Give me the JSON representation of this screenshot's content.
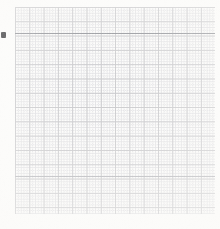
{
  "document": {
    "kind": "scanned-grid-paper",
    "title": "Graph paper scan",
    "width_px": 220,
    "height_px": 229
  },
  "paper": {
    "background_color": "#fdfdfc",
    "edge_color": "#f5f4f0"
  },
  "grid": {
    "left_px": 15,
    "top_px": 7,
    "width_px": 200,
    "height_px": 207,
    "major_spacing_px": 14.3,
    "minor_spacing_px": 2.86,
    "minor_per_major": 5,
    "major_columns": 14,
    "major_rows": 15,
    "major_color": "#c9c9cc",
    "major_line_width_px": 1,
    "minor_color": "#dedee1",
    "minor_dot_period_px": 2,
    "minor_dash_length_px": 1
  },
  "marks": {
    "emphasis_rule": {
      "label": "dark-horizontal-rule",
      "y_px": 33,
      "left_px": 15,
      "width_px": 200,
      "color": "#8e9096",
      "thickness_px": 1
    },
    "secondary_rule": {
      "label": "secondary-horizontal-rule",
      "y_px": 176,
      "left_px": 15,
      "width_px": 200,
      "color": "#b4b5ba",
      "thickness_px": 1
    },
    "ink_mark": {
      "label": "ink-blot",
      "x_px": 1,
      "y_px": 32,
      "width_px": 5,
      "height_px": 6,
      "color": "#2c2c30"
    }
  }
}
